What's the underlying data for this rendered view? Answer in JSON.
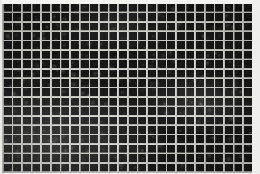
{
  "image": {
    "kind": "grid-texture-photograph",
    "description": "Scanned monochrome photograph of a dark rectangular mesh / grid plate on a white paper background",
    "width": 260,
    "height": 174,
    "background_color": "#f2f2f0"
  },
  "plate": {
    "left": 2,
    "top": 4,
    "width": 250,
    "height": 169,
    "columns": 26,
    "rows": 18,
    "cell_pitch_x": 9.62,
    "cell_pitch_y": 9.4,
    "line_thickness": 1.9,
    "line_color": "#b9b9b6",
    "line_color_bright": "#d6d6d2",
    "cell_color": "#1b1b1b",
    "cell_color_dark": "#0e0e0e",
    "cell_color_light": "#2e2e2e"
  },
  "margins": {
    "top_color": "#f4f4f2",
    "right_color": "#eeeeec",
    "bottom_color": "#efefed",
    "left_color": "#e9e9e6",
    "top_height": 4,
    "right_width": 8,
    "bottom_height": 1,
    "left_width": 2
  },
  "chart_data": {
    "type": "heatmap",
    "title": "",
    "xlabel": "",
    "ylabel": "",
    "columns": 26,
    "rows": 18,
    "colormap": "grayscale",
    "value_range": [
      0,
      1
    ],
    "legend": "none",
    "grid": true,
    "note": "Uniform dark grid cells separated by light rules; intensity varies only from photographic grain and uneven exposure"
  }
}
